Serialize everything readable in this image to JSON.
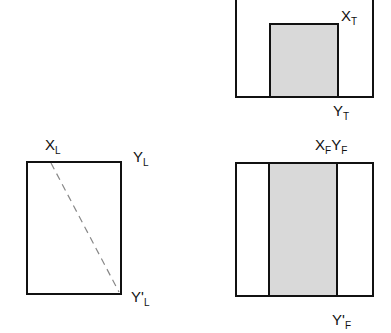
{
  "diagram": {
    "type": "orthographic-projection",
    "views": {
      "top": {
        "labels": [
          {
            "main": "X",
            "sub": "T",
            "prime": ""
          },
          {
            "main": "Y",
            "sub": "T",
            "prime": ""
          }
        ]
      },
      "left": {
        "labels": [
          {
            "main": "X",
            "sub": "L",
            "prime": ""
          },
          {
            "main": "Y",
            "sub": "L",
            "prime": ""
          },
          {
            "main": "Y",
            "sub": "L",
            "prime": "'"
          }
        ]
      },
      "front": {
        "labels": [
          {
            "main": "X",
            "sub": "F",
            "prime": ""
          },
          {
            "main": "Y",
            "sub": "F",
            "prime": ""
          },
          {
            "main": "Y",
            "sub": "F",
            "prime": "'"
          }
        ]
      }
    },
    "colors": {
      "stroke": "#111111",
      "shade": "#d9d9d9",
      "dash": "#888888"
    }
  }
}
